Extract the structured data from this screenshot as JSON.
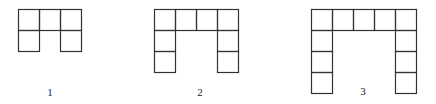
{
  "cell_size": 21,
  "stroke_color": "#333333",
  "figures": [
    {
      "label": "1",
      "origin": [
        18,
        9
      ],
      "cols": 3,
      "rows": 2,
      "cells": [
        [
          0,
          0
        ],
        [
          1,
          0
        ],
        [
          2,
          0
        ],
        [
          0,
          1
        ],
        [
          2,
          1
        ]
      ],
      "label_pos": [
        50,
        87
      ]
    },
    {
      "label": "2",
      "origin": [
        154,
        9
      ],
      "cols": 4,
      "rows": 3,
      "cells": [
        [
          0,
          0
        ],
        [
          1,
          0
        ],
        [
          2,
          0
        ],
        [
          3,
          0
        ],
        [
          0,
          1
        ],
        [
          3,
          1
        ],
        [
          0,
          2
        ],
        [
          3,
          2
        ]
      ],
      "label_pos": [
        200,
        87
      ]
    },
    {
      "label": "3",
      "origin": [
        311,
        9
      ],
      "cols": 5,
      "rows": 4,
      "cells": [
        [
          0,
          0
        ],
        [
          1,
          0
        ],
        [
          2,
          0
        ],
        [
          3,
          0
        ],
        [
          4,
          0
        ],
        [
          0,
          1
        ],
        [
          4,
          1
        ],
        [
          0,
          2
        ],
        [
          4,
          2
        ],
        [
          0,
          3
        ],
        [
          4,
          3
        ]
      ],
      "label_pos": [
        363,
        86
      ]
    }
  ]
}
